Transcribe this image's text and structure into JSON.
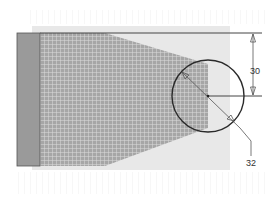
{
  "diagram": {
    "type": "technical-cross-section",
    "colors": {
      "background": "#ffffff",
      "band": "#e6e6e6",
      "bar": "#9a9a9a",
      "hatch_fill": "#a8a8a8",
      "hatch_line": "#d8d8d8",
      "outline": "#333333",
      "dimension": "#555555"
    },
    "dimensions": {
      "height_label": "30",
      "diameter_label": "32"
    }
  }
}
